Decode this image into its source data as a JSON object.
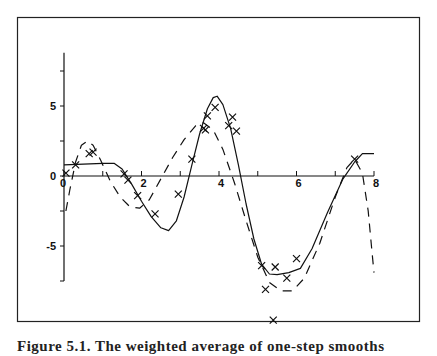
{
  "chart_data": {
    "type": "scatter",
    "title": "",
    "xlabel": "",
    "ylabel": "",
    "xlim": [
      0,
      8
    ],
    "ylim": [
      -7.5,
      8.8
    ],
    "grid": false,
    "legend": null,
    "x_ticks": [
      0,
      1,
      2,
      3,
      4,
      5,
      6,
      7,
      8
    ],
    "x_tick_labels": [
      "0",
      "",
      "2",
      "",
      "4",
      "",
      "6",
      "",
      "8"
    ],
    "y_ticks": [
      -7.5,
      -5,
      -2.5,
      0,
      2.5,
      5,
      7.5
    ],
    "y_tick_labels": [
      "",
      "-5",
      "",
      "0",
      "",
      "5",
      ""
    ],
    "series": [
      {
        "name": "observations",
        "style": "cross-marker",
        "points": [
          [
            0.05,
            0.2
          ],
          [
            0.3,
            0.8
          ],
          [
            0.65,
            1.6
          ],
          [
            0.75,
            1.7
          ],
          [
            1.55,
            0.15
          ],
          [
            1.65,
            -0.3
          ],
          [
            1.9,
            -1.4
          ],
          [
            2.35,
            -2.7
          ],
          [
            2.95,
            -1.3
          ],
          [
            3.3,
            1.2
          ],
          [
            3.6,
            3.4
          ],
          [
            3.65,
            3.3
          ],
          [
            3.7,
            4.3
          ],
          [
            3.9,
            4.9
          ],
          [
            4.25,
            3.6
          ],
          [
            4.35,
            4.2
          ],
          [
            4.45,
            3.2
          ],
          [
            5.1,
            -6.4
          ],
          [
            5.2,
            -8.1
          ],
          [
            5.45,
            -6.5
          ],
          [
            5.75,
            -7.3
          ],
          [
            6.0,
            -5.9
          ],
          [
            5.4,
            -10.3
          ],
          [
            7.5,
            1.2
          ]
        ]
      },
      {
        "name": "fit-solid",
        "style": "solid-line",
        "points": [
          [
            0,
            0.8
          ],
          [
            0.5,
            0.85
          ],
          [
            1.0,
            0.9
          ],
          [
            1.3,
            0.9
          ],
          [
            1.5,
            0.5
          ],
          [
            1.75,
            -0.6
          ],
          [
            2.0,
            -1.8
          ],
          [
            2.25,
            -2.9
          ],
          [
            2.5,
            -3.7
          ],
          [
            2.7,
            -3.9
          ],
          [
            2.9,
            -3.2
          ],
          [
            3.1,
            -1.5
          ],
          [
            3.3,
            0.8
          ],
          [
            3.5,
            3.0
          ],
          [
            3.7,
            4.8
          ],
          [
            3.85,
            5.6
          ],
          [
            3.95,
            5.7
          ],
          [
            4.1,
            5.1
          ],
          [
            4.3,
            3.4
          ],
          [
            4.5,
            0.8
          ],
          [
            4.7,
            -2.0
          ],
          [
            4.9,
            -4.5
          ],
          [
            5.1,
            -6.3
          ],
          [
            5.3,
            -7.0
          ],
          [
            5.5,
            -7.05
          ],
          [
            5.8,
            -6.9
          ],
          [
            6.1,
            -6.6
          ],
          [
            6.4,
            -5.2
          ],
          [
            6.8,
            -2.6
          ],
          [
            7.2,
            -0.2
          ],
          [
            7.5,
            1.0
          ],
          [
            7.7,
            1.6
          ],
          [
            8.0,
            1.6
          ]
        ]
      },
      {
        "name": "fit-dashed",
        "style": "dashed-line",
        "points": [
          [
            0.05,
            -2.5
          ],
          [
            0.15,
            -1.0
          ],
          [
            0.3,
            1.0
          ],
          [
            0.45,
            2.2
          ],
          [
            0.6,
            2.5
          ],
          [
            0.75,
            2.2
          ],
          [
            0.95,
            1.1
          ],
          [
            1.2,
            -0.4
          ],
          [
            1.45,
            -1.5
          ],
          [
            1.7,
            -2.2
          ],
          [
            1.95,
            -2.3
          ],
          [
            2.2,
            -1.7
          ],
          [
            2.5,
            -0.2
          ],
          [
            2.8,
            1.3
          ],
          [
            3.1,
            2.6
          ],
          [
            3.4,
            3.6
          ],
          [
            3.6,
            3.8
          ],
          [
            3.85,
            3.3
          ],
          [
            4.1,
            1.9
          ],
          [
            4.4,
            -0.5
          ],
          [
            4.7,
            -3.2
          ],
          [
            5.0,
            -5.8
          ],
          [
            5.3,
            -7.6
          ],
          [
            5.6,
            -8.2
          ],
          [
            5.9,
            -8.2
          ],
          [
            6.2,
            -7.3
          ],
          [
            6.6,
            -4.8
          ],
          [
            7.0,
            -1.5
          ],
          [
            7.3,
            0.6
          ],
          [
            7.5,
            1.2
          ],
          [
            7.7,
            0.2
          ],
          [
            7.85,
            -2.5
          ],
          [
            7.95,
            -5.5
          ],
          [
            8.0,
            -6.9
          ]
        ]
      }
    ]
  },
  "caption": {
    "text": "Figure 5.1.  The weighted average of one-step smooths"
  }
}
